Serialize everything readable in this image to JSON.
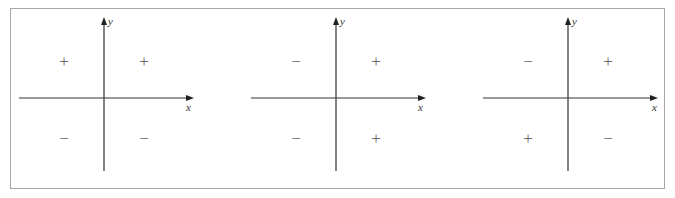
{
  "figure": {
    "border_color": "#a8a8a8",
    "axis_color": "#333333",
    "sign_color": "#666666",
    "panels": [
      {
        "id": "panel-1",
        "origin": [
          104,
          98
        ],
        "x_axis": {
          "label": "x",
          "from": 19,
          "to": 192
        },
        "y_axis": {
          "label": "y",
          "from": 18,
          "to": 171
        },
        "quadrants": {
          "II": "+",
          "I": "+",
          "III": "−",
          "IV": "−"
        }
      },
      {
        "id": "panel-2",
        "origin": [
          336,
          98
        ],
        "x_axis": {
          "label": "x",
          "from": 251,
          "to": 424
        },
        "y_axis": {
          "label": "y",
          "from": 18,
          "to": 171
        },
        "quadrants": {
          "II": "−",
          "I": "+",
          "III": "−",
          "IV": "+"
        }
      },
      {
        "id": "panel-3",
        "origin": [
          568,
          98
        ],
        "x_axis": {
          "label": "x",
          "from": 483,
          "to": 656
        },
        "y_axis": {
          "label": "y",
          "from": 18,
          "to": 171
        },
        "quadrants": {
          "II": "−",
          "I": "+",
          "III": "+",
          "IV": "−"
        }
      }
    ]
  }
}
